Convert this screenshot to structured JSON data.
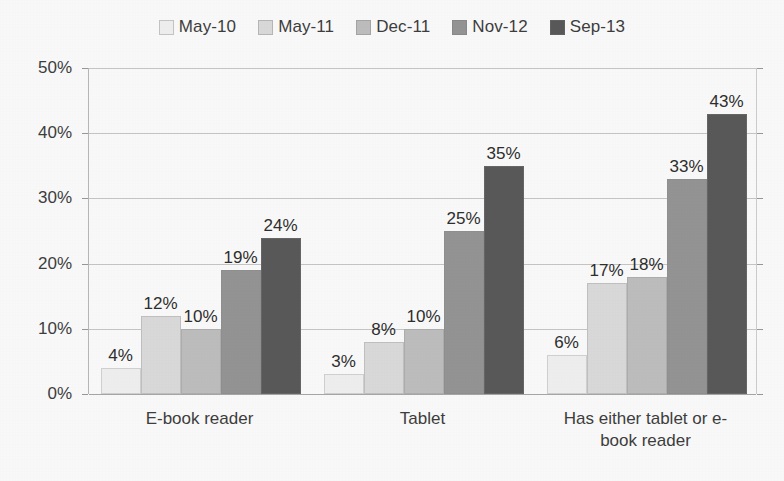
{
  "chart_data": {
    "type": "bar",
    "title": "",
    "xlabel": "",
    "ylabel": "",
    "ylim": [
      0,
      50
    ],
    "grid": true,
    "legend_position": "top",
    "y_ticks": [
      "0%",
      "10%",
      "20%",
      "30%",
      "40%",
      "50%"
    ],
    "categories": [
      "E-book reader",
      "Tablet",
      "Has either tablet or e-book reader"
    ],
    "series": [
      {
        "name": "May-10",
        "color": "#f2f2f2",
        "values": [
          4,
          3,
          6
        ],
        "labels": [
          "4%",
          "3%",
          "6%"
        ]
      },
      {
        "name": "May-11",
        "color": "#dcdcdc",
        "values": [
          12,
          8,
          17
        ],
        "labels": [
          "12%",
          "8%",
          "17%"
        ]
      },
      {
        "name": "Dec-11",
        "color": "#c0c0c0",
        "values": [
          10,
          10,
          18
        ],
        "labels": [
          "10%",
          "10%",
          "18%"
        ]
      },
      {
        "name": "Nov-12",
        "color": "#969696",
        "values": [
          19,
          25,
          33
        ],
        "labels": [
          "19%",
          "25%",
          "33%"
        ]
      },
      {
        "name": "Sep-13",
        "color": "#5a5a5a",
        "values": [
          24,
          35,
          43
        ],
        "labels": [
          "24%",
          "35%",
          "43%"
        ]
      }
    ]
  },
  "category_lines": [
    [
      "E-book reader"
    ],
    [
      "Tablet"
    ],
    [
      "Has either tablet or e-",
      "book reader"
    ]
  ]
}
